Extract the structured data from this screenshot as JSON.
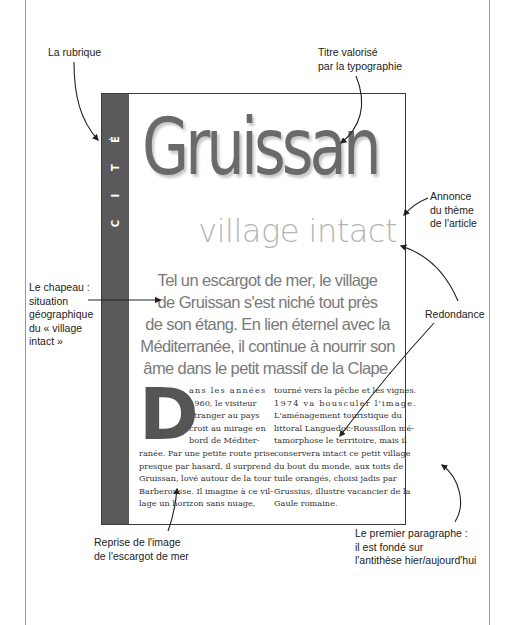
{
  "article": {
    "rubrique": [
      "C",
      "I",
      "T",
      "É"
    ],
    "title": "Gruissan",
    "subtitle": "village intact",
    "chapeau_lines": [
      "Tel un escargot de mer, le village",
      "de Gruissan s'est niché tout près",
      "de son étang. En lien éternel avec la",
      "Méditerranée, il continue à nourrir son",
      "âme dans le petit massif de la Clape."
    ],
    "dropcap": "D",
    "column_left_lines": [
      "ans les années",
      "1960, le visiteur",
      "étranger au pays",
      "croit au mirage en",
      "bord de Méditer-",
      "ranée. Par une petite route prise",
      "presque par hasard, il surprend",
      "Gruissan, lové autour de la tour",
      "Barberousse. Il imagine à ce vil-",
      "lage un horizon sans nuage,"
    ],
    "column_right_lines": [
      "tourné vers la pêche et les vignes.",
      "1974 va bousculer l'image.",
      "L'aménagement touristique du",
      "littoral Languedoc-Roussillon mé-",
      "tamorphose le territoire, mais il",
      "conservera intact ce petit village",
      "du bout du monde, aux toits de",
      "tuile orangés, choisi jadis par",
      "Grussius, illustre vacancier de la",
      "Gaule romaine."
    ]
  },
  "annotations": {
    "rubrique": [
      "La rubrique"
    ],
    "titre": [
      "Titre valorisé",
      "par la typographie"
    ],
    "annonce": [
      "Annonce",
      "du thème",
      "de l'article"
    ],
    "chapeau": [
      "Le chapeau :",
      "situation",
      "géographique",
      "du « village",
      "intact »"
    ],
    "redondance": [
      "Redondance"
    ],
    "reprise": [
      "Reprise de l'image",
      "de l'escargot de mer"
    ],
    "premier_paragraphe": [
      "Le premier paragraphe :",
      "il est fondé sur",
      "l'antithèse hier/aujourd'hui"
    ]
  },
  "colors": {
    "rubrique_band": "#5a5a5a",
    "title": "#6a6a6a",
    "subtitle": "#b4b4b4",
    "chapeau": "#7a7a7a"
  }
}
